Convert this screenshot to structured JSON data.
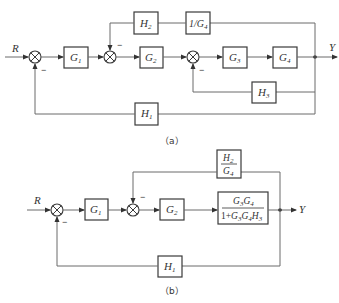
{
  "diagram_a": {
    "caption": "（a）",
    "input_label": "R",
    "output_label": "Y",
    "blocks": {
      "G1": {
        "base": "G",
        "sub": "1"
      },
      "G2": {
        "base": "G",
        "sub": "2"
      },
      "G3": {
        "base": "G",
        "sub": "3"
      },
      "G4": {
        "base": "G",
        "sub": "4"
      },
      "H1": {
        "base": "H",
        "sub": "1"
      },
      "H2": {
        "base": "H",
        "sub": "2"
      },
      "H3": {
        "base": "H",
        "sub": "3"
      },
      "invG4": {
        "base": "1/G",
        "sub": "4"
      }
    },
    "signs": {
      "sum1_feedback": "−",
      "sum2_feedback": "−",
      "sum3_feedback": "−"
    }
  },
  "diagram_b": {
    "caption": "（b）",
    "input_label": "R",
    "output_label": "Y",
    "blocks": {
      "G1": {
        "base": "G",
        "sub": "1"
      },
      "G2": {
        "base": "G",
        "sub": "2"
      },
      "H1": {
        "base": "H",
        "sub": "1"
      },
      "H2_over_G4": {
        "num_base": "H",
        "num_sub": "2",
        "den_base": "G",
        "den_sub": "4"
      },
      "closed_loop": {
        "numerator": "G3G4",
        "num_parts": [
          {
            "base": "G",
            "sub": "3"
          },
          {
            "base": "G",
            "sub": "4"
          }
        ],
        "denominator": "1+G3G4H3",
        "den_prefix": "1+",
        "den_parts": [
          {
            "base": "G",
            "sub": "3"
          },
          {
            "base": "G",
            "sub": "4"
          },
          {
            "base": "H",
            "sub": "3"
          }
        ]
      }
    },
    "signs": {
      "sum1_feedback": "−",
      "sum2_feedback": "−"
    }
  }
}
